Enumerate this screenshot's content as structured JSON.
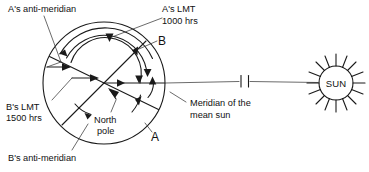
{
  "figure": {
    "title_present": false,
    "background_color": "#ffffff",
    "ink_color": "#1a1a1a",
    "width": 369,
    "height": 172
  },
  "labels": {
    "a_anti_meridian": "A's anti-meridian",
    "a_lmt_line1": "A's LMT",
    "a_lmt_line2": "1000 hrs",
    "b_lmt_line1": "B's LMT",
    "b_lmt_line2": "1500 hrs",
    "b_anti_meridian": "B's anti-meridian",
    "north_pole_line1": "North",
    "north_pole_line2": "pole",
    "meridian_mean_sun_line1": "Meridian of the",
    "meridian_mean_sun_line2": "mean sun",
    "point_a": "A",
    "point_b": "B",
    "sun": "SUN"
  },
  "icons": {
    "sun": "sun-icon",
    "earth": "earth-disc-icon",
    "leader_arrow": "leader-arrow-icon",
    "angle_arc": "angle-arc-icon"
  }
}
